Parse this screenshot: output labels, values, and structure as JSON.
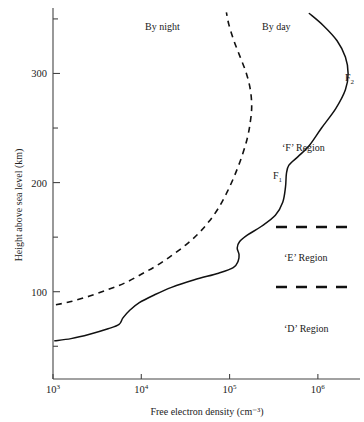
{
  "chart_data": {
    "type": "line",
    "title": "",
    "xlabel": "Free electron density (cm⁻³)",
    "ylabel": "Height above sea level (km)",
    "xscale": "log",
    "xlim": [
      1000,
      3000000
    ],
    "ylim": [
      20,
      360
    ],
    "grid": false,
    "legend_position": "inline-annotations",
    "xticks": [
      {
        "value": 1000,
        "label_base": "10",
        "label_exp": "3"
      },
      {
        "value": 10000,
        "label_base": "10",
        "label_exp": "4"
      },
      {
        "value": 100000,
        "label_base": "10",
        "label_exp": "5"
      },
      {
        "value": 1000000,
        "label_base": "10",
        "label_exp": "6"
      }
    ],
    "yticks_major": [
      {
        "value": 100,
        "label": "100"
      },
      {
        "value": 200,
        "label": "200"
      },
      {
        "value": 300,
        "label": "300"
      }
    ],
    "yticks_minor": [
      50,
      150,
      250,
      350
    ],
    "series": [
      {
        "name": "By day",
        "style": "solid",
        "points": [
          [
            1050,
            55
          ],
          [
            1600,
            57
          ],
          [
            2600,
            61
          ],
          [
            4200,
            66
          ],
          [
            5600,
            70
          ],
          [
            6200,
            76
          ],
          [
            7400,
            83
          ],
          [
            9500,
            90
          ],
          [
            14000,
            97
          ],
          [
            22000,
            104
          ],
          [
            40000,
            111
          ],
          [
            75000,
            117
          ],
          [
            110000,
            122
          ],
          [
            125000,
            128
          ],
          [
            128000,
            134
          ],
          [
            122000,
            140
          ],
          [
            130000,
            146
          ],
          [
            160000,
            152
          ],
          [
            230000,
            160
          ],
          [
            330000,
            170
          ],
          [
            400000,
            182
          ],
          [
            430000,
            196
          ],
          [
            440000,
            208
          ],
          [
            470000,
            216
          ],
          [
            600000,
            224
          ],
          [
            800000,
            234
          ],
          [
            1100000,
            250
          ],
          [
            1600000,
            268
          ],
          [
            2050000,
            285
          ],
          [
            2200000,
            300
          ],
          [
            2050000,
            315
          ],
          [
            1650000,
            330
          ],
          [
            1150000,
            344
          ],
          [
            800000,
            355
          ]
        ]
      },
      {
        "name": "By night",
        "style": "dashed",
        "points": [
          [
            1080,
            88
          ],
          [
            1600,
            91
          ],
          [
            2600,
            96
          ],
          [
            4200,
            102
          ],
          [
            6500,
            108
          ],
          [
            10000,
            116
          ],
          [
            15000,
            124
          ],
          [
            22000,
            133
          ],
          [
            32000,
            143
          ],
          [
            44000,
            153
          ],
          [
            58000,
            164
          ],
          [
            74000,
            176
          ],
          [
            92000,
            190
          ],
          [
            112000,
            205
          ],
          [
            135000,
            222
          ],
          [
            158000,
            240
          ],
          [
            172000,
            256
          ],
          [
            178000,
            270
          ],
          [
            172000,
            285
          ],
          [
            155000,
            300
          ],
          [
            132000,
            315
          ],
          [
            112000,
            330
          ],
          [
            98000,
            345
          ],
          [
            92000,
            356
          ]
        ]
      }
    ],
    "annotations": [
      {
        "name": "by-night-label",
        "text": "By night",
        "x": 145,
        "y": 30
      },
      {
        "name": "by-day-label",
        "text": "By day",
        "x": 262,
        "y": 30
      },
      {
        "name": "f2-label",
        "base": "F",
        "sub": "2",
        "x": 345,
        "y": 81
      },
      {
        "name": "f-region-label",
        "text": "‘F’ Region",
        "x": 282,
        "y": 151
      },
      {
        "name": "f1-label",
        "base": "F",
        "sub": "1",
        "x": 273,
        "y": 179
      },
      {
        "name": "e-region-label",
        "text": "‘E’ Region",
        "x": 284,
        "y": 261
      },
      {
        "name": "d-region-label",
        "text": "‘D’ Region",
        "x": 284,
        "y": 332
      }
    ],
    "region_dividers": [
      {
        "name": "e-region-upper-divider",
        "x1": 276,
        "x2": 352,
        "y": 227
      },
      {
        "name": "e-region-lower-divider",
        "x1": 276,
        "x2": 352,
        "y": 287
      }
    ]
  }
}
